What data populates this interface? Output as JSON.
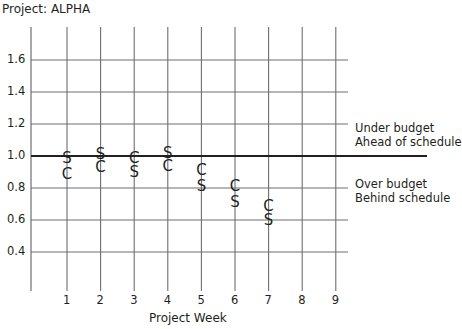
{
  "title": "Project: ALPHA",
  "chart_data": {
    "type": "scatter",
    "title": "Project: ALPHA",
    "xlabel": "Project Week",
    "ylabel": "",
    "x_ticks": [
      1,
      2,
      3,
      4,
      5,
      6,
      7,
      8,
      9
    ],
    "y_ticks": [
      0.4,
      0.6,
      0.8,
      1.0,
      1.2,
      1.4,
      1.6
    ],
    "y_tick_labels": [
      "0.4",
      "0.6",
      "0.8",
      "1.0",
      "1.2",
      "1.4",
      "1.6"
    ],
    "xlim": [
      0,
      9.5
    ],
    "ylim": [
      0.2,
      1.8
    ],
    "grid": true,
    "reference_line": {
      "y": 1.0,
      "style": "bold"
    },
    "series": [
      {
        "name": "S",
        "marker": "S",
        "x": [
          1,
          2,
          3,
          4,
          5,
          6,
          7
        ],
        "values": [
          0.99,
          1.01,
          0.9,
          1.02,
          0.81,
          0.71,
          0.6
        ]
      },
      {
        "name": "C",
        "marker": "C",
        "x": [
          1,
          2,
          3,
          4,
          5,
          6,
          7
        ],
        "values": [
          0.89,
          0.93,
          0.99,
          0.94,
          0.91,
          0.81,
          0.69
        ]
      }
    ],
    "annotations": [
      {
        "text": [
          "Under budget",
          "Ahead of schedule"
        ],
        "position": "right, above 1.0"
      },
      {
        "text": [
          "Over budget",
          "Behind schedule"
        ],
        "position": "right, below 1.0"
      }
    ]
  },
  "annotations": {
    "above": {
      "line1": "Under budget",
      "line2": "Ahead of schedule"
    },
    "below": {
      "line1": "Over budget",
      "line2": "Behind schedule"
    }
  },
  "colors": {
    "grid": "#6d6e70",
    "reference": "#231f20",
    "text": "#231f20"
  }
}
